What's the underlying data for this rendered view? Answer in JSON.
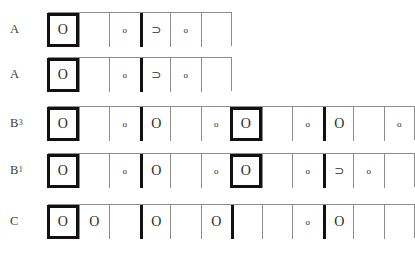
{
  "sheet": {
    "caption": "",
    "symbols": {
      "large_circle": "O",
      "small_circle": "o",
      "superset": "⊃",
      "empty": ""
    },
    "rows": [
      {
        "label": "A",
        "label_base": "A",
        "label_sup": "",
        "cells": [
          {
            "glyph": "O",
            "size": "big",
            "accent": "boxed"
          },
          {
            "glyph": "",
            "size": "empty",
            "accent": "none"
          },
          {
            "glyph": "o",
            "size": "small",
            "accent": "none"
          },
          {
            "glyph": "⊃",
            "size": "sup",
            "accent": "bar-left"
          },
          {
            "glyph": "o",
            "size": "small",
            "accent": "none"
          },
          {
            "glyph": "",
            "size": "empty",
            "accent": "none"
          }
        ]
      },
      {
        "label": "A",
        "label_base": "A",
        "label_sup": "",
        "cells": [
          {
            "glyph": "O",
            "size": "big",
            "accent": "boxed"
          },
          {
            "glyph": "",
            "size": "empty",
            "accent": "none"
          },
          {
            "glyph": "o",
            "size": "small",
            "accent": "none"
          },
          {
            "glyph": "⊃",
            "size": "sup",
            "accent": "bar-left"
          },
          {
            "glyph": "o",
            "size": "small",
            "accent": "none"
          },
          {
            "glyph": "",
            "size": "empty",
            "accent": "none"
          }
        ]
      },
      {
        "label": "B3",
        "label_base": "B",
        "label_sup": "3",
        "cells": [
          {
            "glyph": "O",
            "size": "big",
            "accent": "boxed"
          },
          {
            "glyph": "",
            "size": "empty",
            "accent": "none"
          },
          {
            "glyph": "o",
            "size": "small",
            "accent": "none"
          },
          {
            "glyph": "O",
            "size": "big",
            "accent": "bar-left"
          },
          {
            "glyph": "",
            "size": "empty",
            "accent": "none"
          },
          {
            "glyph": "o",
            "size": "small",
            "accent": "none"
          },
          {
            "glyph": "O",
            "size": "big",
            "accent": "boxed"
          },
          {
            "glyph": "",
            "size": "empty",
            "accent": "none"
          },
          {
            "glyph": "o",
            "size": "small",
            "accent": "none"
          },
          {
            "glyph": "O",
            "size": "big",
            "accent": "bar-left"
          },
          {
            "glyph": "",
            "size": "empty",
            "accent": "none"
          },
          {
            "glyph": "o",
            "size": "small",
            "accent": "none"
          }
        ]
      },
      {
        "label": "B1",
        "label_base": "B",
        "label_sup": "1",
        "cells": [
          {
            "glyph": "O",
            "size": "big",
            "accent": "boxed"
          },
          {
            "glyph": "",
            "size": "empty",
            "accent": "none"
          },
          {
            "glyph": "o",
            "size": "small",
            "accent": "none"
          },
          {
            "glyph": "O",
            "size": "big",
            "accent": "bar-left"
          },
          {
            "glyph": "",
            "size": "empty",
            "accent": "none"
          },
          {
            "glyph": "o",
            "size": "small",
            "accent": "none"
          },
          {
            "glyph": "O",
            "size": "big",
            "accent": "boxed"
          },
          {
            "glyph": "",
            "size": "empty",
            "accent": "none"
          },
          {
            "glyph": "o",
            "size": "small",
            "accent": "none"
          },
          {
            "glyph": "⊃",
            "size": "sup",
            "accent": "bar-left"
          },
          {
            "glyph": "o",
            "size": "small",
            "accent": "none"
          },
          {
            "glyph": "",
            "size": "empty",
            "accent": "none"
          }
        ]
      },
      {
        "label": "C",
        "label_base": "C",
        "label_sup": "",
        "cells": [
          {
            "glyph": "O",
            "size": "big",
            "accent": "boxed"
          },
          {
            "glyph": "O",
            "size": "big",
            "accent": "none"
          },
          {
            "glyph": "",
            "size": "empty",
            "accent": "none"
          },
          {
            "glyph": "O",
            "size": "big",
            "accent": "bar-left"
          },
          {
            "glyph": "",
            "size": "empty",
            "accent": "none"
          },
          {
            "glyph": "O",
            "size": "big",
            "accent": "none"
          },
          {
            "glyph": "",
            "size": "empty",
            "accent": "bar-left"
          },
          {
            "glyph": "",
            "size": "empty",
            "accent": "none"
          },
          {
            "glyph": "o",
            "size": "small",
            "accent": "none"
          },
          {
            "glyph": "O",
            "size": "big",
            "accent": "bar-left"
          },
          {
            "glyph": "",
            "size": "empty",
            "accent": "none"
          },
          {
            "glyph": "",
            "size": "empty",
            "accent": "none"
          }
        ]
      }
    ]
  }
}
